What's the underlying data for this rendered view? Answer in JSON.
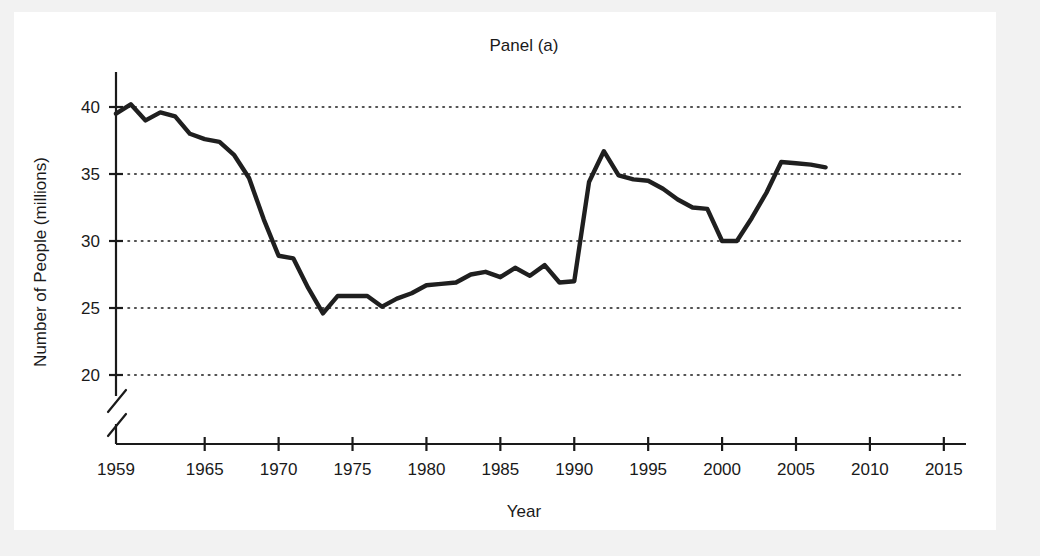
{
  "figure": {
    "title": "Panel (a)",
    "x_axis_label": "Year",
    "y_axis_label": "Number of People (millions)",
    "line_color": "#1f1f1f",
    "background_color": "#ffffff",
    "page_background_color": "#f2f2f2",
    "axis_color": "#1a1a1a"
  },
  "chart_data": {
    "type": "line",
    "title": "Panel (a)",
    "xlabel": "Year",
    "ylabel": "Number of People (millions)",
    "xlim": [
      1959,
      2016.5
    ],
    "ylim": [
      20,
      41
    ],
    "grid": true,
    "legend": "none",
    "axis_break": true,
    "axis_break_note": "y-axis broken below 20",
    "xticks": [
      1959,
      1965,
      1970,
      1975,
      1980,
      1985,
      1990,
      1995,
      2000,
      2005,
      2010,
      2015
    ],
    "xtick_labels": [
      "1959",
      "1965",
      "1970",
      "1975",
      "1980",
      "1985",
      "1990",
      "1995",
      "2000",
      "2005",
      "2010",
      "2015"
    ],
    "yticks": [
      20,
      25,
      30,
      35,
      40
    ],
    "ytick_labels": [
      "20",
      "25",
      "30",
      "35",
      "40"
    ],
    "x": [
      1959,
      1960,
      1961,
      1962,
      1963,
      1964,
      1965,
      1966,
      1967,
      1968,
      1969,
      1970,
      1971,
      1972,
      1973,
      1974,
      1975,
      1976,
      1977,
      1978,
      1979,
      1980,
      1981,
      1982,
      1983,
      1984,
      1985,
      1986,
      1987,
      1988,
      1989,
      1990,
      1991,
      1992,
      1993,
      1994,
      1995,
      1996,
      1997,
      1998,
      1999,
      2000,
      2001,
      2002,
      2003,
      2004,
      2005,
      2006,
      2007
    ],
    "values": [
      39.5,
      40.2,
      39.0,
      39.6,
      39.3,
      38.0,
      37.6,
      37.4,
      36.4,
      34.7,
      31.6,
      28.9,
      28.7,
      26.5,
      24.6,
      25.9,
      25.9,
      25.9,
      25.1,
      25.7,
      26.1,
      26.7,
      26.8,
      26.9,
      27.5,
      27.7,
      27.3,
      28.0,
      27.4,
      28.2,
      26.9,
      27.0,
      34.4,
      36.7,
      34.9,
      34.6,
      34.5,
      33.9,
      33.1,
      32.5,
      32.4,
      32.8,
      33.1,
      34.3,
      36.0,
      37.5,
      38.9,
      38.0,
      36.8
    ],
    "series_note": "Single series; line ends at 2007 near 35.5",
    "tail_x": [
      2000,
      2001,
      2002,
      2003,
      2004,
      2005,
      2006,
      2007
    ],
    "tail_values": [
      30.0,
      30.0,
      31.7,
      33.6,
      35.9,
      35.8,
      35.7,
      35.5
    ]
  }
}
